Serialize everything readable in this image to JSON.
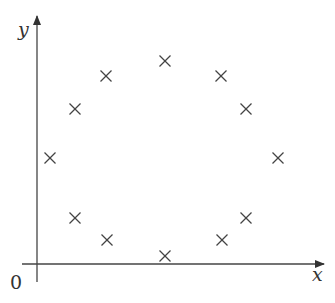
{
  "diagram": {
    "x_axis_label": "x",
    "y_axis_label": "y",
    "origin_label": "0",
    "axis_color": "#444444",
    "marker_symbol": "×",
    "markers": [
      {
        "x": 165,
        "y": 61
      },
      {
        "x": 106,
        "y": 76
      },
      {
        "x": 221,
        "y": 76
      },
      {
        "x": 75,
        "y": 109
      },
      {
        "x": 246,
        "y": 109
      },
      {
        "x": 50,
        "y": 158
      },
      {
        "x": 278,
        "y": 158
      },
      {
        "x": 75,
        "y": 218
      },
      {
        "x": 246,
        "y": 218
      },
      {
        "x": 107,
        "y": 240
      },
      {
        "x": 222,
        "y": 240
      },
      {
        "x": 165,
        "y": 256
      }
    ]
  }
}
